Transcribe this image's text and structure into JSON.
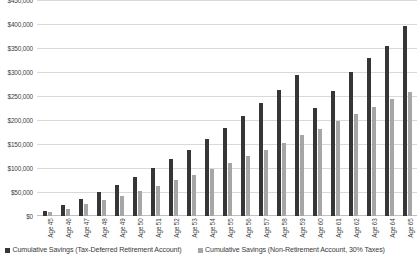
{
  "chart_data": {
    "type": "bar",
    "title": "",
    "xlabel": "",
    "ylabel": "",
    "ylim": [
      0,
      450000
    ],
    "grid": true,
    "legend_position": "bottom",
    "categories": [
      "Age 45",
      "Age 46",
      "Age 47",
      "Age 48",
      "Age 49",
      "Age 50",
      "Age 51",
      "Age 52",
      "Age 53",
      "Age 54",
      "Age 55",
      "Age 56",
      "Age 57",
      "Age 58",
      "Age 59",
      "Age 60",
      "Age 61",
      "Age 62",
      "Age 63",
      "Age 64",
      "Age 65"
    ],
    "ytick_labels": [
      "$450,000",
      "$400,000",
      "$350,000",
      "$300,000",
      "$250,000",
      "$200,000",
      "$150,000",
      "$100,000",
      "$50,000",
      "$0"
    ],
    "ytick_values": [
      450000,
      400000,
      350000,
      300000,
      250000,
      200000,
      150000,
      100000,
      50000,
      0
    ],
    "series": [
      {
        "name": "Cumulative Savings (Tax-Deferred Retirement Account)",
        "color": "#363636",
        "values": [
          11000,
          23000,
          36000,
          50000,
          65000,
          81000,
          99000,
          118000,
          138000,
          160000,
          183000,
          208000,
          235000,
          263000,
          293000,
          226000,
          261000,
          299000,
          330000,
          355000,
          395000
        ]
      },
      {
        "name": "Cumulative Savings (Non-Retirement Account, 30% Taxes)",
        "color": "#a6a6a6",
        "values": [
          7500,
          15500,
          24000,
          33000,
          42500,
          52500,
          63000,
          74000,
          85500,
          98000,
          110500,
          124000,
          138000,
          152500,
          168000,
          182000,
          198000,
          213000,
          228000,
          243000,
          258000
        ]
      }
    ]
  },
  "legend": {
    "items": [
      {
        "label": "Cumulative Savings (Tax-Deferred Retirement Account)",
        "color": "#363636"
      },
      {
        "label": "Cumulative Savings (Non-Retirement Account, 30% Taxes)",
        "color": "#a6a6a6"
      }
    ]
  },
  "colors": {
    "primary_series": "#363636",
    "secondary_series": "#a6a6a6",
    "gridline": "#d9d9d9",
    "background": "#ffffff",
    "text": "#404040"
  }
}
